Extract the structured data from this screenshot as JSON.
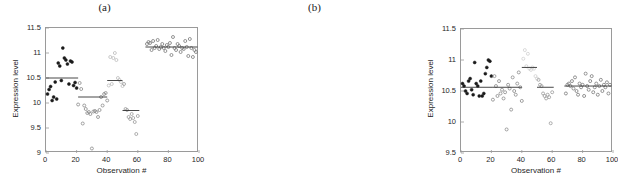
{
  "figure": {
    "caption_a": "(a)",
    "caption_b": "(b)"
  },
  "chart_data": [
    {
      "type": "scatter",
      "panel": "a",
      "title": "(a)",
      "xlabel": "Observation #",
      "ylabel": "Expression level",
      "xlim": [
        0,
        100
      ],
      "ylim": [
        9,
        11.5
      ],
      "xticks": [
        0,
        20,
        40,
        60,
        80,
        100
      ],
      "yticks": [
        9,
        9.5,
        10,
        10.5,
        11,
        11.5
      ],
      "xtick_labels": [
        "0",
        "20",
        "40",
        "60",
        "80",
        "100"
      ],
      "ytick_labels": [
        "9",
        "9.5",
        "10",
        "10.5",
        "11",
        "11.5"
      ],
      "grid": false,
      "legend": "none",
      "marker": "open-circle",
      "description": "Un-normalized expression levels per observation; arrays/batches show differing medians",
      "groups": [
        {
          "name": "batch-1",
          "color": "#1a1a1a",
          "filled": true,
          "mean_line": {
            "x0": 0,
            "x1": 21,
            "y": 10.5
          },
          "points": [
            [
              1,
              10.18
            ],
            [
              2,
              10.27
            ],
            [
              3,
              10.33
            ],
            [
              4,
              10.05
            ],
            [
              5,
              10.12
            ],
            [
              6,
              10.42
            ],
            [
              7,
              10.08
            ],
            [
              8,
              10.8
            ],
            [
              9,
              10.74
            ],
            [
              10,
              10.45
            ],
            [
              11,
              11.1
            ],
            [
              12,
              10.9
            ],
            [
              13,
              10.86
            ],
            [
              14,
              10.78
            ],
            [
              15,
              10.38
            ],
            [
              16,
              10.84
            ],
            [
              17,
              10.82
            ],
            [
              18,
              10.35
            ],
            [
              19,
              10.41
            ],
            [
              20,
              10.3
            ]
          ]
        },
        {
          "name": "batch-2",
          "color": "#8a8a8a",
          "filled": false,
          "mean_line": {
            "x0": 21,
            "x1": 40,
            "y": 10.12
          },
          "points": [
            [
              21,
              9.97
            ],
            [
              22,
              10.4
            ],
            [
              23,
              10.28
            ],
            [
              24,
              9.59
            ],
            [
              25,
              9.95
            ],
            [
              26,
              9.88
            ],
            [
              27,
              9.8
            ],
            [
              28,
              9.82
            ],
            [
              29,
              9.78
            ],
            [
              30,
              9.09
            ],
            [
              31,
              9.83
            ],
            [
              32,
              9.84
            ],
            [
              33,
              9.82
            ],
            [
              34,
              9.72
            ],
            [
              35,
              9.86
            ],
            [
              36,
              10.12
            ],
            [
              37,
              9.95
            ],
            [
              38,
              10.18
            ],
            [
              39,
              10.2
            ],
            [
              40,
              10.05
            ]
          ]
        },
        {
          "name": "batch-3",
          "color": "#bdbdbd",
          "filled": false,
          "mean_line": {
            "x0": 40,
            "x1": 50,
            "y": 10.45
          },
          "points": [
            [
              41,
              10.35
            ],
            [
              42,
              10.92
            ],
            [
              43,
              10.38
            ],
            [
              44,
              10.9
            ],
            [
              45,
              11.0
            ],
            [
              46,
              10.86
            ],
            [
              47,
              10.5
            ],
            [
              48,
              10.46
            ],
            [
              49,
              10.42
            ],
            [
              50,
              10.34
            ]
          ]
        },
        {
          "name": "batch-4",
          "color": "#9a9a9a",
          "filled": false,
          "mean_line": {
            "x0": 50,
            "x1": 61,
            "y": 9.85
          },
          "points": [
            [
              51,
              10.38
            ],
            [
              52,
              9.88
            ],
            [
              53,
              9.86
            ],
            [
              54,
              9.72
            ],
            [
              55,
              9.68
            ],
            [
              56,
              9.78
            ],
            [
              57,
              9.7
            ],
            [
              58,
              9.62
            ],
            [
              59,
              9.38
            ],
            [
              60,
              9.74
            ]
          ]
        },
        {
          "name": "batch-5",
          "color": "#7a7a7a",
          "filled": false,
          "mean_line": {
            "x0": 65,
            "x1": 99,
            "y": 11.12
          },
          "points": [
            [
              66,
              11.18
            ],
            [
              67,
              11.22
            ],
            [
              68,
              11.2
            ],
            [
              69,
              11.06
            ],
            [
              70,
              11.24
            ],
            [
              71,
              11.1
            ],
            [
              72,
              11.14
            ],
            [
              73,
              11.26
            ],
            [
              74,
              11.08
            ],
            [
              75,
              11.12
            ],
            [
              76,
              11.18
            ],
            [
              77,
              11.1
            ],
            [
              78,
              11.04
            ],
            [
              79,
              11.16
            ],
            [
              80,
              11.12
            ],
            [
              81,
              11.2
            ],
            [
              82,
              10.96
            ],
            [
              83,
              11.32
            ],
            [
              84,
              11.1
            ],
            [
              85,
              11.06
            ],
            [
              86,
              11.18
            ],
            [
              87,
              11.14
            ],
            [
              88,
              11.02
            ],
            [
              89,
              11.1
            ],
            [
              90,
              11.08
            ],
            [
              91,
              11.24
            ],
            [
              92,
              11.12
            ],
            [
              93,
              10.94
            ],
            [
              94,
              11.28
            ],
            [
              95,
              11.1
            ],
            [
              96,
              10.92
            ],
            [
              97,
              11.06
            ],
            [
              98,
              11.02
            ]
          ]
        }
      ]
    },
    {
      "type": "scatter",
      "panel": "b",
      "title": "(b)",
      "xlabel": "Observation #",
      "ylabel": "Expression level",
      "xlim": [
        0,
        100
      ],
      "ylim": [
        9.5,
        11.5
      ],
      "xticks": [
        0,
        20,
        40,
        60,
        80,
        100
      ],
      "yticks": [
        9.5,
        10,
        10.5,
        11,
        11.5
      ],
      "xtick_labels": [
        "0",
        "20",
        "40",
        "60",
        "80",
        "100"
      ],
      "ytick_labels": [
        "9.5",
        "10",
        "10.5",
        "11",
        "11.5"
      ],
      "grid": false,
      "legend": "none",
      "marker": "open-circle",
      "description": "Normalized expression levels; all batch medians aligned near 10.55",
      "groups": [
        {
          "name": "batch-1",
          "color": "#1a1a1a",
          "filled": true,
          "mean_line": {
            "x0": 0,
            "x1": 21,
            "y": 10.56
          },
          "points": [
            [
              1,
              10.62
            ],
            [
              2,
              10.58
            ],
            [
              3,
              10.5
            ],
            [
              4,
              10.46
            ],
            [
              5,
              10.66
            ],
            [
              6,
              10.7
            ],
            [
              7,
              10.52
            ],
            [
              8,
              10.44
            ],
            [
              9,
              10.96
            ],
            [
              10,
              10.62
            ],
            [
              11,
              10.58
            ],
            [
              12,
              10.42
            ],
            [
              13,
              10.66
            ],
            [
              14,
              10.42
            ],
            [
              15,
              10.46
            ],
            [
              16,
              10.78
            ],
            [
              17,
              10.88
            ],
            [
              18,
              11.0
            ],
            [
              19,
              10.98
            ],
            [
              20,
              10.74
            ]
          ]
        },
        {
          "name": "batch-2",
          "color": "#8a8a8a",
          "filled": false,
          "mean_line": {
            "x0": 21,
            "x1": 40,
            "y": 10.56
          },
          "points": [
            [
              21,
              10.36
            ],
            [
              22,
              10.74
            ],
            [
              23,
              10.58
            ],
            [
              24,
              10.42
            ],
            [
              25,
              10.66
            ],
            [
              26,
              10.46
            ],
            [
              27,
              10.52
            ],
            [
              28,
              10.38
            ],
            [
              29,
              10.48
            ],
            [
              30,
              9.88
            ],
            [
              31,
              10.6
            ],
            [
              32,
              10.54
            ],
            [
              33,
              10.2
            ],
            [
              34,
              10.72
            ],
            [
              35,
              10.5
            ],
            [
              36,
              10.44
            ],
            [
              37,
              10.62
            ],
            [
              38,
              10.8
            ],
            [
              39,
              10.56
            ],
            [
              40,
              10.34
            ]
          ]
        },
        {
          "name": "batch-3",
          "color": "#d0d0d0",
          "filled": false,
          "mean_line": {
            "x0": 40,
            "x1": 50,
            "y": 10.88
          },
          "points": [
            [
              41,
              11.02
            ],
            [
              42,
              11.16
            ],
            [
              43,
              10.9
            ],
            [
              44,
              11.1
            ],
            [
              45,
              10.86
            ],
            [
              46,
              10.84
            ],
            [
              47,
              10.88
            ],
            [
              48,
              10.86
            ],
            [
              49,
              10.74
            ],
            [
              50,
              10.7
            ]
          ]
        },
        {
          "name": "batch-4",
          "color": "#9a9a9a",
          "filled": false,
          "mean_line": {
            "x0": 50,
            "x1": 61,
            "y": 10.56
          },
          "points": [
            [
              51,
              10.68
            ],
            [
              52,
              10.6
            ],
            [
              53,
              10.58
            ],
            [
              54,
              10.46
            ],
            [
              55,
              10.42
            ],
            [
              56,
              10.38
            ],
            [
              57,
              10.44
            ],
            [
              58,
              10.4
            ],
            [
              59,
              9.98
            ],
            [
              60,
              10.48
            ]
          ]
        },
        {
          "name": "batch-5",
          "color": "#7a7a7a",
          "filled": false,
          "mean_line": {
            "x0": 68,
            "x1": 99,
            "y": 10.58
          },
          "points": [
            [
              69,
              10.46
            ],
            [
              70,
              10.6
            ],
            [
              71,
              10.62
            ],
            [
              72,
              10.58
            ],
            [
              73,
              10.66
            ],
            [
              74,
              10.54
            ],
            [
              75,
              10.72
            ],
            [
              76,
              10.5
            ],
            [
              77,
              10.44
            ],
            [
              78,
              10.62
            ],
            [
              79,
              10.56
            ],
            [
              80,
              10.6
            ],
            [
              81,
              10.42
            ],
            [
              82,
              10.78
            ],
            [
              83,
              10.58
            ],
            [
              84,
              10.52
            ],
            [
              85,
              10.66
            ],
            [
              86,
              10.74
            ],
            [
              87,
              10.48
            ],
            [
              88,
              10.56
            ],
            [
              89,
              10.62
            ],
            [
              90,
              10.44
            ],
            [
              91,
              10.58
            ],
            [
              92,
              10.68
            ],
            [
              93,
              10.5
            ],
            [
              94,
              10.6
            ],
            [
              95,
              10.56
            ],
            [
              96,
              10.64
            ],
            [
              97,
              10.46
            ],
            [
              98,
              10.6
            ]
          ]
        }
      ]
    }
  ]
}
